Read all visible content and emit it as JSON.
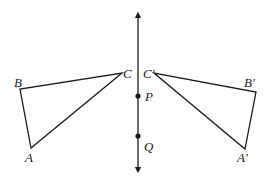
{
  "figure": {
    "colors": {
      "stroke": "#1a1a1a",
      "background": "#ffffff"
    },
    "axis": {
      "x": 138,
      "y_top": 13,
      "y_bottom": 172,
      "points": [
        {
          "name": "P",
          "label": "P",
          "x": 138,
          "y": 96
        },
        {
          "name": "Q",
          "label": "Q",
          "x": 138,
          "y": 136
        }
      ]
    },
    "triangle_original": {
      "vertices": [
        {
          "name": "A",
          "label": "A",
          "x": 31,
          "y": 148
        },
        {
          "name": "B",
          "label": "B",
          "x": 20,
          "y": 89
        },
        {
          "name": "C",
          "label": "C",
          "x": 122,
          "y": 73
        }
      ]
    },
    "triangle_image": {
      "vertices": [
        {
          "name": "A'",
          "label": "A'",
          "x": 245,
          "y": 149
        },
        {
          "name": "B'",
          "label": "B'",
          "x": 256,
          "y": 92
        },
        {
          "name": "C'",
          "label": "C'",
          "x": 154,
          "y": 73
        }
      ]
    },
    "labels": {
      "A": "A",
      "B": "B",
      "C": "C",
      "A_prime": "A′",
      "B_prime": "B′",
      "C_prime": "C′",
      "P": "P",
      "Q": "Q"
    }
  }
}
